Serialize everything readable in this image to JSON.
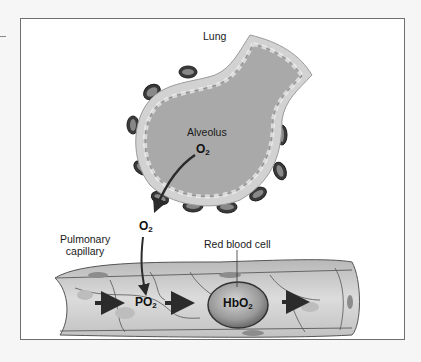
{
  "figure": {
    "labels": {
      "lung": "Lung",
      "alveolus": "Alveolus",
      "pulmonary_capillary_line1": "Pulmonary",
      "pulmonary_capillary_line2": "capillary",
      "red_blood_cell": "Red blood cell"
    },
    "chemicals": {
      "alveolar_o2": {
        "base": "O",
        "sub": "2"
      },
      "diffusing_o2": {
        "base": "O",
        "sub": "2"
      },
      "plasma_po2": {
        "base": "PO",
        "sub": "2"
      },
      "hbo2": {
        "base": "HbO",
        "sub": "2"
      }
    },
    "colors": {
      "frame_border": "#6f6f6f",
      "alveolus_fill": "#a9a9a9",
      "wall_fill": "#d2d2d2",
      "capillary_fill": "#c8c8c8",
      "rbc_fill": "#8e8e8e",
      "arrow": "#2b2b2b"
    }
  }
}
